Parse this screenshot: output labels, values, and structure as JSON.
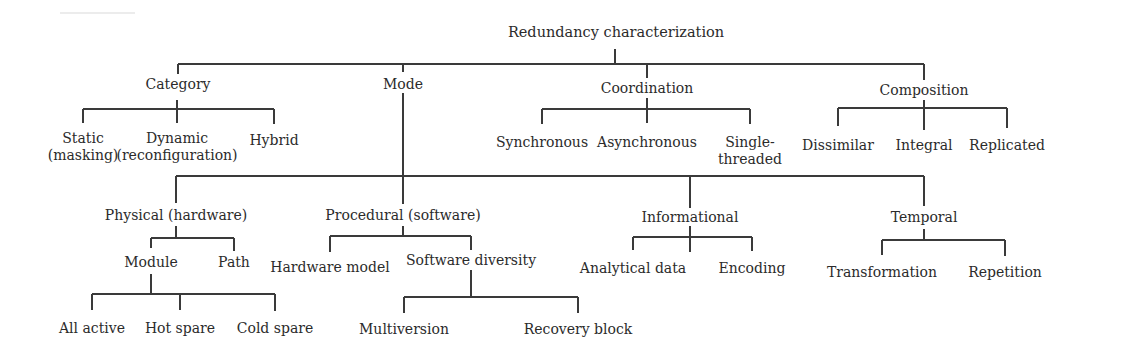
{
  "diagram": {
    "title": "Redundancy characterization",
    "root": {
      "label": "Redundancy characterization"
    },
    "category": {
      "label": "Category",
      "children": [
        {
          "line1": "Static",
          "line2": "(masking)"
        },
        {
          "line1": "Dynamic",
          "line2": "(reconfiguration)"
        },
        {
          "line1": "Hybrid"
        }
      ]
    },
    "mode": {
      "label": "Mode",
      "children": {
        "physical": {
          "label": "Physical (hardware)",
          "children": {
            "module": {
              "label": "Module",
              "children": [
                "All active",
                "Hot spare",
                "Cold spare"
              ]
            },
            "path": {
              "label": "Path"
            }
          }
        },
        "procedural": {
          "label": "Procedural (software)",
          "children": {
            "hardware_model": {
              "label": "Hardware model"
            },
            "software_diversity": {
              "label": "Software diversity",
              "children": [
                "Multiversion",
                "Recovery block"
              ]
            }
          }
        },
        "informational": {
          "label": "Informational",
          "children": [
            "Analytical data",
            "Encoding"
          ]
        },
        "temporal": {
          "label": "Temporal",
          "children": [
            "Transformation",
            "Repetition"
          ]
        }
      }
    },
    "coordination": {
      "label": "Coordination",
      "children": [
        {
          "line1": "Synchronous"
        },
        {
          "line1": "Asynchronous"
        },
        {
          "line1": "Single-",
          "line2": "threaded"
        }
      ]
    },
    "composition": {
      "label": "Composition",
      "children": [
        "Dissimilar",
        "Integral",
        "Replicated"
      ]
    },
    "colors": {
      "line": "#3a3a3a",
      "text": "#2b2b2b",
      "background": "#ffffff"
    }
  }
}
